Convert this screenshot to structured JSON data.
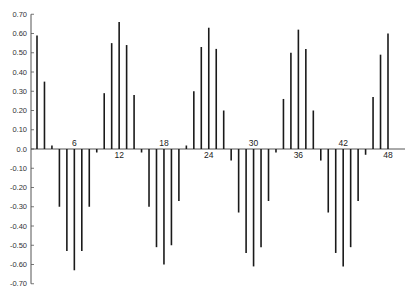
{
  "chart_data": {
    "type": "bar",
    "subtype": "stem/correlogram",
    "title": "",
    "xlabel": "",
    "ylabel": "",
    "ylim": [
      -0.7,
      0.7
    ],
    "xlim": [
      0,
      48
    ],
    "grid": false,
    "legend": null,
    "y_ticks": [
      0.7,
      0.6,
      0.5,
      0.4,
      0.3,
      0.2,
      0.1,
      0.0,
      -0.1,
      -0.2,
      -0.3,
      -0.4,
      -0.5,
      -0.6,
      -0.7
    ],
    "y_tick_labels": [
      "0.70",
      "0.60",
      "0.50",
      "0.40",
      "0.30",
      "0.20",
      "0.10",
      "0.0",
      "-0.10",
      "-0.20",
      "-0.30",
      "-0.40",
      "-0.50",
      "-0.60",
      "-0.70"
    ],
    "x_tick_labels": [
      {
        "lag": 6,
        "label": "6",
        "side": "above"
      },
      {
        "lag": 12,
        "label": "12",
        "side": "below"
      },
      {
        "lag": 18,
        "label": "18",
        "side": "above"
      },
      {
        "lag": 24,
        "label": "24",
        "side": "below"
      },
      {
        "lag": 30,
        "label": "30",
        "side": "above"
      },
      {
        "lag": 36,
        "label": "36",
        "side": "below"
      },
      {
        "lag": 42,
        "label": "42",
        "side": "above"
      },
      {
        "lag": 48,
        "label": "48",
        "side": "below"
      }
    ],
    "x": [
      1,
      2,
      3,
      4,
      5,
      6,
      7,
      8,
      9,
      10,
      11,
      12,
      13,
      14,
      15,
      16,
      17,
      18,
      19,
      20,
      21,
      22,
      23,
      24,
      25,
      26,
      27,
      28,
      29,
      30,
      31,
      32,
      33,
      34,
      35,
      36,
      37,
      38,
      39,
      40,
      41,
      42,
      43,
      44,
      45,
      46,
      47,
      48
    ],
    "values": [
      0.59,
      0.35,
      0.01,
      -0.3,
      -0.53,
      -0.63,
      -0.53,
      -0.3,
      -0.02,
      0.29,
      0.55,
      0.66,
      0.54,
      0.28,
      -0.02,
      -0.3,
      -0.51,
      -0.6,
      -0.5,
      -0.27,
      0.01,
      0.3,
      0.53,
      0.63,
      0.52,
      0.2,
      -0.06,
      -0.33,
      -0.54,
      -0.61,
      -0.51,
      -0.27,
      -0.02,
      0.26,
      0.5,
      0.62,
      0.52,
      0.2,
      -0.06,
      -0.33,
      -0.54,
      -0.61,
      -0.51,
      -0.27,
      -0.03,
      0.27,
      0.49,
      0.6
    ]
  },
  "style": {
    "bar_color": "#1a1a1a",
    "axis_color": "#555555"
  }
}
